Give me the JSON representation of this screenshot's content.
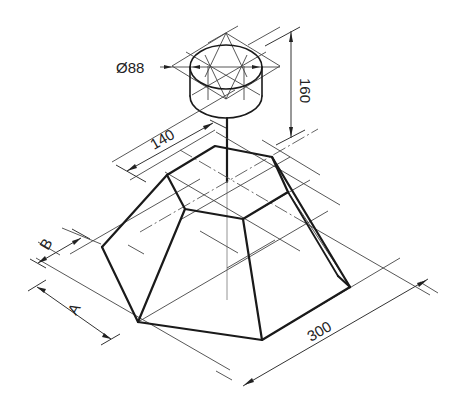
{
  "drawing": {
    "title": "Isometric view - hexagonal frustum with cylinder on rod",
    "dimensions": {
      "diameter_label": "Ø88",
      "height_label": "160",
      "top_width_label": "140",
      "base_width_label": "300",
      "label_a": "A",
      "label_b": "B"
    },
    "colors": {
      "line": "#1a1a1a",
      "construction": "#444444",
      "background": "#ffffff"
    }
  }
}
